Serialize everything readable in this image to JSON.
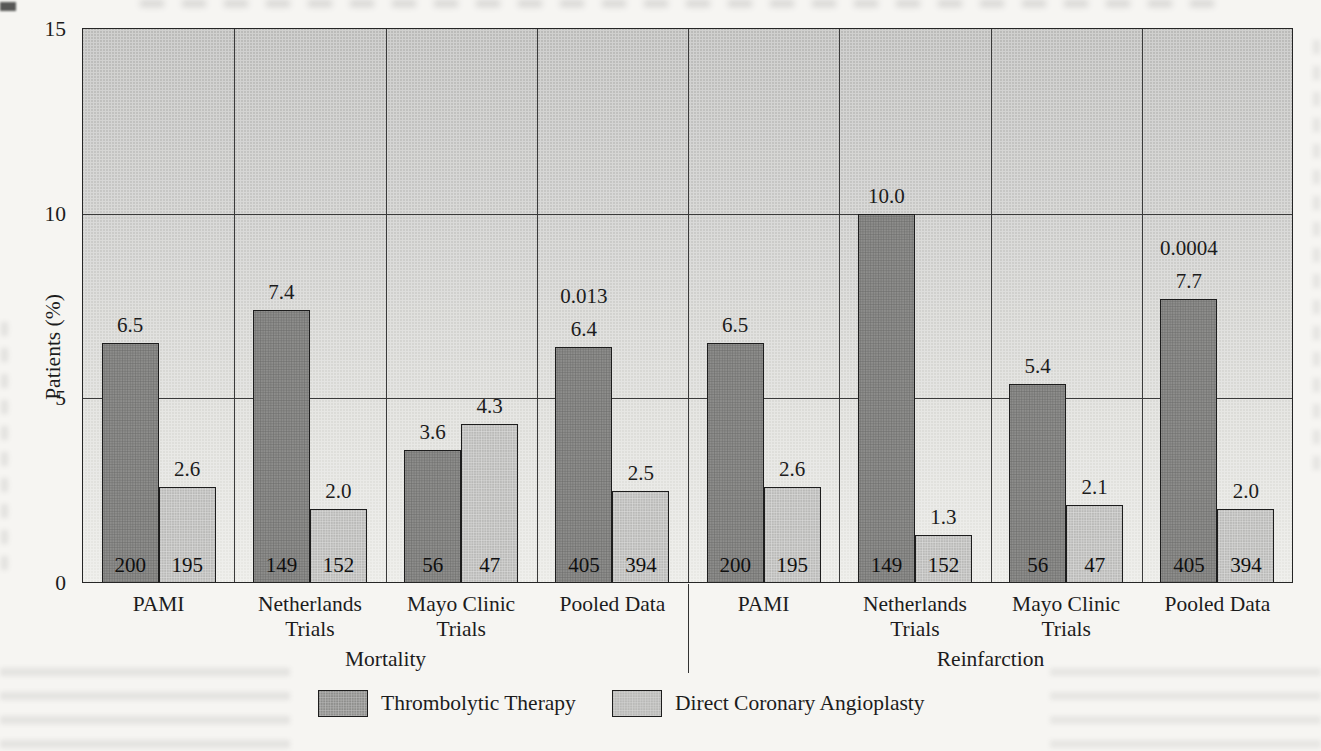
{
  "figure_type": "scanned journal figure, grouped bar chart",
  "colors": {
    "bar_thrombolytic": "#8e8e8c",
    "bar_angioplasty": "#b9b9b7",
    "plot_bg_top": "#bbbbb9",
    "plot_bg_bottom": "#e9e9e5",
    "line": "#2a2a2a",
    "text": "#1c1c1c",
    "page_bg": "#f6f5f2"
  },
  "chart_data": {
    "type": "bar",
    "title": "",
    "xlabel": "",
    "ylabel": "Patients (%)",
    "ylim": [
      0,
      15
    ],
    "yticks": [
      "0",
      "5",
      "10",
      "15"
    ],
    "grid": "horizontal lines at 5 and 10, vertical lines between categories",
    "legend_position": "bottom",
    "series_names": [
      "Thrombolytic Therapy",
      "Direct Coronary Angioplasty"
    ],
    "groups": [
      {
        "label": "Mortality",
        "categories": [
          {
            "label_lines": [
              "PAMI"
            ],
            "values": [
              6.5,
              2.6
            ],
            "value_labels": [
              "6.5",
              "2.6"
            ],
            "n_labels": [
              "200",
              "195"
            ],
            "p_value_label": null
          },
          {
            "label_lines": [
              "Netherlands",
              "Trials"
            ],
            "values": [
              7.4,
              2.0
            ],
            "value_labels": [
              "7.4",
              "2.0"
            ],
            "n_labels": [
              "149",
              "152"
            ],
            "p_value_label": null
          },
          {
            "label_lines": [
              "Mayo Clinic",
              "Trials"
            ],
            "values": [
              3.6,
              4.3
            ],
            "value_labels": [
              "3.6",
              "4.3"
            ],
            "n_labels": [
              "56",
              "47"
            ],
            "p_value_label": null
          },
          {
            "label_lines": [
              "Pooled Data"
            ],
            "values": [
              6.4,
              2.5
            ],
            "value_labels": [
              "6.4",
              "2.5"
            ],
            "n_labels": [
              "405",
              "394"
            ],
            "p_value_label": "0.013"
          }
        ]
      },
      {
        "label": "Reinfarction",
        "categories": [
          {
            "label_lines": [
              "PAMI"
            ],
            "values": [
              6.5,
              2.6
            ],
            "value_labels": [
              "6.5",
              "2.6"
            ],
            "n_labels": [
              "200",
              "195"
            ],
            "p_value_label": null
          },
          {
            "label_lines": [
              "Netherlands",
              "Trials"
            ],
            "values": [
              10.0,
              1.3
            ],
            "value_labels": [
              "10.0",
              "1.3"
            ],
            "n_labels": [
              "149",
              "152"
            ],
            "p_value_label": null
          },
          {
            "label_lines": [
              "Mayo Clinic",
              "Trials"
            ],
            "values": [
              5.4,
              2.1
            ],
            "value_labels": [
              "5.4",
              "2.1"
            ],
            "n_labels": [
              "56",
              "47"
            ],
            "p_value_label": null
          },
          {
            "label_lines": [
              "Pooled Data"
            ],
            "values": [
              7.7,
              2.0
            ],
            "value_labels": [
              "7.7",
              "2.0"
            ],
            "n_labels": [
              "405",
              "394"
            ],
            "p_value_label": "0.0004"
          }
        ]
      }
    ]
  }
}
